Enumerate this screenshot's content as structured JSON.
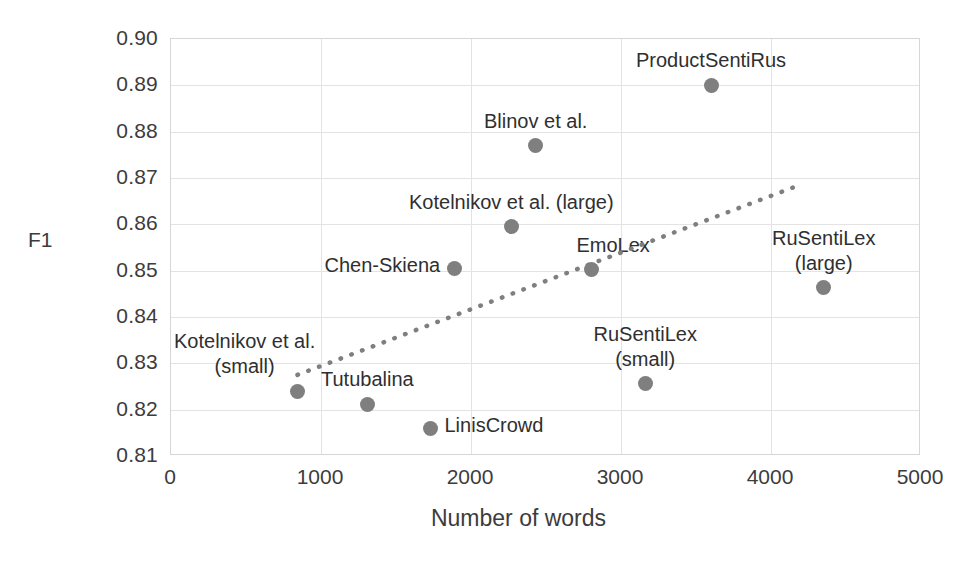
{
  "chart_data": {
    "type": "scatter",
    "title": "",
    "xlabel": "Number of words",
    "ylabel": "F1",
    "xlim": [
      0,
      5000
    ],
    "ylim": [
      0.81,
      0.9
    ],
    "xticks": [
      "0",
      "1000",
      "2000",
      "3000",
      "4000",
      "5000"
    ],
    "xtick_values": [
      0,
      1000,
      2000,
      3000,
      4000,
      5000
    ],
    "yticks": [
      "0.90",
      "0.89",
      "0.88",
      "0.87",
      "0.86",
      "0.85",
      "0.84",
      "0.83",
      "0.82",
      "0.81"
    ],
    "ytick_values": [
      0.9,
      0.89,
      0.88,
      0.87,
      0.86,
      0.85,
      0.84,
      0.83,
      0.82,
      0.81
    ],
    "grid": true,
    "legend": "none",
    "marker_color": "#7f7f7f",
    "trendline": {
      "style": "dotted",
      "color": "#7f7f7f",
      "x_start": 850,
      "y_start": 0.8273,
      "x_end": 4200,
      "y_end": 0.8683
    },
    "points": [
      {
        "label": "Kotelnikov et al.\n(small)",
        "x": 840,
        "y": 0.824,
        "label_pos": "above-left"
      },
      {
        "label": "Tutubalina",
        "x": 1310,
        "y": 0.8212,
        "label_pos": "above"
      },
      {
        "label": "LinisCrowd",
        "x": 1730,
        "y": 0.816,
        "label_pos": "right"
      },
      {
        "label": "Chen-Skiena",
        "x": 1890,
        "y": 0.8504,
        "label_pos": "left"
      },
      {
        "label": "Kotelnikov et al. (large)",
        "x": 2270,
        "y": 0.8595,
        "label_pos": "above"
      },
      {
        "label": "Blinov et al.",
        "x": 2430,
        "y": 0.877,
        "label_pos": "above"
      },
      {
        "label": "EmoLex",
        "x": 2800,
        "y": 0.8502,
        "label_pos": "above-right"
      },
      {
        "label": "RuSentiLex\n(small)",
        "x": 3160,
        "y": 0.8256,
        "label_pos": "above"
      },
      {
        "label": "ProductSentiRus",
        "x": 3600,
        "y": 0.89,
        "label_pos": "above"
      },
      {
        "label": "RuSentiLex\n(large)",
        "x": 4350,
        "y": 0.8463,
        "label_pos": "above"
      }
    ]
  },
  "point_labels": {
    "kotelnikov_small_line1": "Kotelnikov et al.",
    "kotelnikov_small_line2": "(small)",
    "tutubalina": "Tutubalina",
    "liniscrowd": "LinisCrowd",
    "chen_skiena": "Chen-Skiena",
    "kotelnikov_large": "Kotelnikov et al. (large)",
    "blinov": "Blinov et al.",
    "emolex": "EmoLex",
    "rusentilex_small_line1": "RuSentiLex",
    "rusentilex_small_line2": "(small)",
    "productsentirus": "ProductSentiRus",
    "rusentilex_large_line1": "RuSentiLex",
    "rusentilex_large_line2": "(large)"
  }
}
